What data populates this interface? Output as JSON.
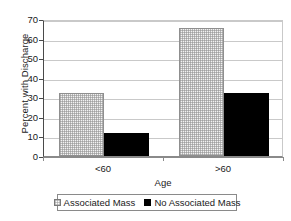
{
  "chart_data": {
    "type": "bar",
    "title": "",
    "xlabel": "Age",
    "ylabel": "Percent with Discharge",
    "categories": [
      "<60",
      ">60"
    ],
    "series": [
      {
        "name": "Associated Mass",
        "values": [
          32,
          65.5
        ],
        "fill": "hatched",
        "color": "#f2f2f2"
      },
      {
        "name": "No Associated Mass",
        "values": [
          12,
          32
        ],
        "fill": "solid",
        "color": "#000000"
      }
    ],
    "ylim": [
      0,
      70
    ],
    "yticks": [
      0,
      10,
      20,
      30,
      40,
      50,
      60,
      70
    ],
    "ytick_labels": [
      "0",
      "10",
      "20",
      "30",
      "40",
      "50",
      "60",
      "70"
    ],
    "grid": true,
    "legend_position": "bottom"
  },
  "legend": {
    "items": [
      {
        "label": "Associated Mass",
        "swatch": "hatched-square-swatch"
      },
      {
        "label": "No Associated Mass",
        "swatch": "black-square-swatch"
      }
    ]
  }
}
